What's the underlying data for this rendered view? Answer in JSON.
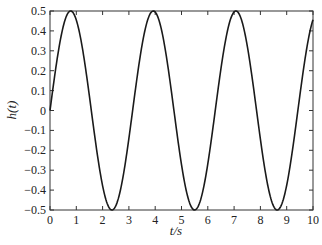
{
  "chart_data": {
    "type": "line",
    "title": "",
    "xlabel": "t/s",
    "ylabel": "h(t)",
    "xlim": [
      0,
      10
    ],
    "ylim": [
      -0.5,
      0.5
    ],
    "grid": false,
    "legend": null,
    "x_ticks": [
      "0",
      "1",
      "2",
      "3",
      "4",
      "5",
      "6",
      "7",
      "8",
      "9",
      "10"
    ],
    "y_ticks": [
      "0.5",
      "0.4",
      "0.3",
      "0.2",
      "0.1",
      "0",
      "-0.1",
      "-0.2",
      "-0.3",
      "-0.4",
      "-0.5"
    ],
    "function": "h(t) = 0.5*sin(2t)",
    "series": [
      {
        "name": "h(t)",
        "x": [
          0,
          0.5,
          0.785,
          1.0,
          1.5,
          2.0,
          2.356,
          2.5,
          3.0,
          3.5,
          3.927,
          4.0,
          4.5,
          5.0,
          5.498,
          5.5,
          6.0,
          6.5,
          7.069,
          7.5,
          8.0,
          8.639,
          9.0,
          9.5,
          10.0
        ],
        "values": [
          0,
          0.42,
          0.5,
          0.455,
          0.071,
          -0.378,
          -0.5,
          -0.479,
          -0.14,
          0.328,
          0.5,
          0.495,
          0.206,
          -0.272,
          -0.5,
          -0.5,
          -0.268,
          0.21,
          0.5,
          0.325,
          -0.144,
          -0.5,
          -0.375,
          0.075,
          0.456
        ]
      }
    ],
    "line_color": "#1a1a1a",
    "axis_color": "#333333"
  }
}
